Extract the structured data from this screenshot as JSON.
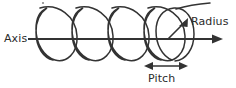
{
  "figure": {
    "type": "line-drawing",
    "background_color": "#ffffff",
    "stroke_color": "#333333",
    "text_color": "#2b2b2b",
    "width": 236,
    "height": 88,
    "labels": {
      "axis": "Axis",
      "radius": "Radius",
      "pitch": "Pitch"
    },
    "annotations": {
      "axis": {
        "label": "Axis",
        "description": "horizontal arrow through the centre of the helix pointing right"
      },
      "radius": {
        "label": "Radius",
        "description": "short arrow from the axis to the top of the right-most coil"
      },
      "pitch": {
        "label": "Pitch",
        "description": "double-headed arrow spanning one coil-to-coil distance along the axis"
      }
    },
    "helix": {
      "coil_count": 5,
      "coil_tilt": "right-leaning ellipses",
      "axis_y": 39,
      "coil_top_y": 6,
      "coil_bottom_y": 61,
      "first_coil_center_x": 55,
      "coil_spacing_x": 36,
      "coil_radius_x": 22,
      "coil_radius_y": 27
    }
  }
}
